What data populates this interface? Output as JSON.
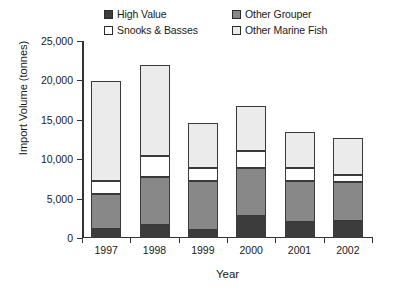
{
  "chart_data": {
    "type": "bar",
    "subtype": "stacked-vertical",
    "title": "",
    "xlabel": "Year",
    "ylabel": "Import Volume (tonnes)",
    "categories": [
      "1997",
      "1998",
      "1999",
      "2000",
      "2001",
      "2002"
    ],
    "ylim": [
      0,
      25000
    ],
    "ytick_values": [
      0,
      5000,
      10000,
      15000,
      20000,
      25000
    ],
    "ytick_labels": [
      "0",
      "5,000",
      "10,000",
      "15,000",
      "20,000",
      "25,000"
    ],
    "grid": false,
    "legend_position": "top",
    "series": [
      {
        "name": "High Value",
        "color": "#3c3c3c",
        "values": [
          1100,
          1600,
          1000,
          2800,
          2000,
          2200
        ]
      },
      {
        "name": "Other Grouper",
        "color": "#888888",
        "values": [
          4530,
          6145,
          6200,
          6100,
          5200,
          4900
        ]
      },
      {
        "name": "Snooks & Basses",
        "color": "#ffffff",
        "values": [
          1610,
          2685,
          1700,
          2100,
          1620,
          900
        ]
      },
      {
        "name": "Other Marine Fish",
        "color": "#ebebeb",
        "values": [
          12660,
          11570,
          5700,
          5800,
          4600,
          4700
        ]
      }
    ],
    "totals": [
      19900,
      22000,
      14600,
      16800,
      13420,
      12700
    ]
  },
  "legend": {
    "entries": [
      {
        "label": "High Value",
        "swatch": "#3c3c3c"
      },
      {
        "label": "Other Grouper",
        "swatch": "#888888"
      },
      {
        "label": "Snooks & Basses",
        "swatch": "#ffffff"
      },
      {
        "label": "Other Marine Fish",
        "swatch": "#ebebeb"
      }
    ]
  }
}
